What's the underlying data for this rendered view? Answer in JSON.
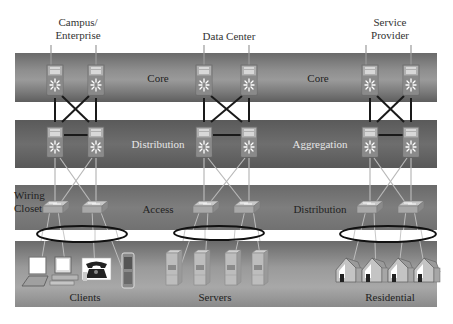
{
  "diagram": {
    "type": "hierarchical network architecture",
    "columns": [
      {
        "id": "campus",
        "title_line1": "Campus/",
        "title_line2": "Enterprise"
      },
      {
        "id": "datacenter",
        "title_line1": "Data Center",
        "title_line2": ""
      },
      {
        "id": "provider",
        "title_line1": "Service",
        "title_line2": "Provider"
      }
    ],
    "layers": {
      "core": {
        "campus": "Core",
        "provider": "Core"
      },
      "middle": {
        "campus": "Distribution",
        "provider": "Aggregation"
      },
      "edge": {
        "campus": "Access",
        "provider": "Distribution",
        "side_label_line1": "Wiring",
        "side_label_line2": "Closet"
      },
      "endpoints": {
        "campus": "Clients",
        "datacenter": "Servers",
        "provider": "Residential"
      }
    },
    "nodes": {
      "core_switches": 6,
      "distribution_switches": 6,
      "access_switches": 6,
      "client_devices": [
        "laptop",
        "desktop",
        "telephone",
        "mobile-phone"
      ],
      "servers": 4,
      "houses": 4
    },
    "colors": {
      "band_dark": "#5e5e5e",
      "band_light": "#9a9a9a",
      "link_dark": "#1a1a1a",
      "link_light": "#b8b8b8",
      "ellipse": "#111111"
    }
  }
}
